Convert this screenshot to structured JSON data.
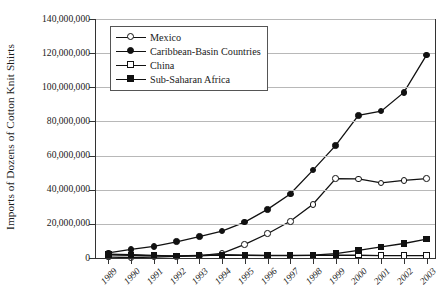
{
  "chart_data": {
    "type": "line",
    "title": "",
    "xlabel": "",
    "ylabel": "Imports of Dozens of Cotton Knit Shirts",
    "categories": [
      "1989",
      "1990",
      "1991",
      "1992",
      "1993",
      "1994",
      "1995",
      "1996",
      "1997",
      "1998",
      "1999",
      "2000",
      "2001",
      "2002",
      "2003"
    ],
    "ylim": [
      0,
      140000000
    ],
    "ytick_values": [
      0,
      20000000,
      40000000,
      60000000,
      80000000,
      100000000,
      120000000,
      140000000
    ],
    "ytick_labels": [
      "0",
      "20,000,000",
      "40,000,000",
      "60,000,000",
      "80,000,000",
      "100,000,000",
      "120,000,000",
      "140,000,000"
    ],
    "grid": true,
    "legend_position": "upper-left-inside",
    "series": [
      {
        "name": "Mexico",
        "marker": "circle-open",
        "values": [
          500000,
          300000,
          500000,
          900000,
          1400000,
          2700000,
          8000000,
          14200000,
          21500000,
          31500000,
          46500000,
          46300000,
          44000000,
          45500000,
          46500000
        ]
      },
      {
        "name": "Caribbean-Basin Countries",
        "marker": "circle-filled",
        "values": [
          3000000,
          5000000,
          6800000,
          9500000,
          12500000,
          15800000,
          21000000,
          28500000,
          37500000,
          51500000,
          66000000,
          83500000,
          86000000,
          97000000,
          119000000
        ]
      },
      {
        "name": "China",
        "marker": "square-open",
        "values": [
          1800000,
          1600000,
          1300000,
          1200000,
          1500000,
          1600000,
          1500000,
          1400000,
          1400000,
          1500000,
          1600000,
          1600000,
          1400000,
          1400000,
          1400000
        ]
      },
      {
        "name": "Sub-Saharan Africa",
        "marker": "square-filled",
        "values": [
          2200000,
          1900000,
          1500000,
          1100000,
          1300000,
          1900000,
          1600000,
          1500000,
          1500000,
          1700000,
          2600000,
          4500000,
          6500000,
          8500000,
          11000000
        ]
      }
    ]
  },
  "legend": {
    "items": [
      {
        "label": "Mexico"
      },
      {
        "label": "Caribbean-Basin Countries"
      },
      {
        "label": "China"
      },
      {
        "label": "Sub-Saharan Africa"
      }
    ]
  },
  "colors": {
    "line": "#111111",
    "grid": "#b8b8b8",
    "axis": "#333333",
    "text": "#1a1a1a",
    "background": "#ffffff"
  }
}
